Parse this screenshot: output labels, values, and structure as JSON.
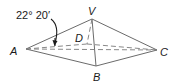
{
  "diagram": {
    "type": "pyramid",
    "angle_label": "22° 20′",
    "vertices": {
      "A": {
        "label": "A",
        "x": 26,
        "y": 49
      },
      "V": {
        "label": "V",
        "x": 92,
        "y": 19
      },
      "B": {
        "label": "B",
        "x": 96,
        "y": 66
      },
      "C": {
        "label": "C",
        "x": 157,
        "y": 50
      },
      "D": {
        "label": "D",
        "x": 87,
        "y": 44
      }
    },
    "colors": {
      "edge": "#6b6b6b",
      "text": "#1a1a1a",
      "background": "#ffffff"
    }
  }
}
